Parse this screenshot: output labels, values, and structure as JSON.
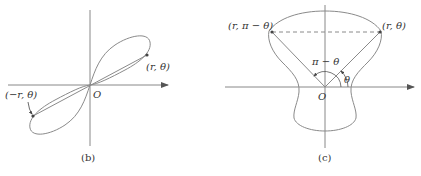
{
  "panel_b": {
    "caption": "(b)",
    "origin_label": "O",
    "point_label": "(r, θ)",
    "neg_point_label": "(−r, θ)"
  },
  "panel_c": {
    "caption": "(c)",
    "origin_label": "O",
    "left_point_label": "(r, π − θ)",
    "right_point_label": "(r, θ)",
    "angle_big_label": "π − θ",
    "angle_small_label": "θ"
  },
  "colors": {
    "curve": "#8a8a8a",
    "axis": "#777777",
    "text": "#333333"
  }
}
